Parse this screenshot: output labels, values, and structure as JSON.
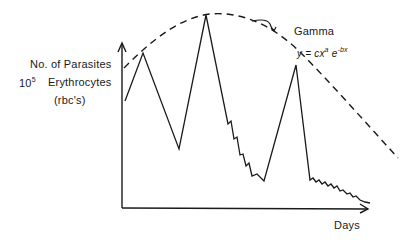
{
  "chart_data": {
    "type": "line",
    "title": "",
    "xlabel": "Days",
    "ylabel": "No. of Parasites / 10^5 Erythrocytes (rbc's)",
    "ylabel_lines": [
      "No. of Parasites",
      "10",
      "5",
      "Erythrocytes",
      "(rbc's)"
    ],
    "grid": false,
    "axis_ticks": "none",
    "series": [
      {
        "name": "Parasitemia",
        "style": "solid",
        "description": "Relapsing waves: rise to first peak, fall to trough, rise to highest peak, step-wise decline to trough, rise to third peak, then sharp drop followed by step-wise decline toward baseline",
        "points_px": [
          [
            125,
            101
          ],
          [
            143,
            53
          ],
          [
            179,
            149
          ],
          [
            206,
            15
          ],
          [
            228,
            124
          ],
          [
            231,
            121
          ],
          [
            234,
            139
          ],
          [
            237,
            137
          ],
          [
            240,
            155
          ],
          [
            243,
            154
          ],
          [
            246,
            166
          ],
          [
            249,
            163
          ],
          [
            252,
            176
          ],
          [
            257,
            174
          ],
          [
            264,
            181
          ],
          [
            296,
            65
          ],
          [
            310,
            180
          ],
          [
            313,
            178
          ],
          [
            316,
            182
          ],
          [
            319,
            180
          ],
          [
            322,
            184
          ],
          [
            325,
            182
          ],
          [
            328,
            186
          ],
          [
            331,
            184
          ],
          [
            334,
            188
          ],
          [
            337,
            186
          ],
          [
            340,
            191
          ],
          [
            343,
            190
          ],
          [
            347,
            194
          ],
          [
            350,
            193
          ],
          [
            353,
            197
          ],
          [
            356,
            196
          ],
          [
            360,
            200
          ],
          [
            365,
            202
          ],
          [
            370,
            203
          ]
        ]
      },
      {
        "name": "Gamma",
        "style": "dashed",
        "equation": "y = cx^a e^-bx",
        "points_px": [
          [
            124,
            68
          ],
          [
            150,
            45
          ],
          [
            180,
            24
          ],
          [
            210,
            14
          ],
          [
            240,
            18
          ],
          [
            270,
            30
          ],
          [
            300,
            54
          ],
          [
            330,
            88
          ],
          [
            360,
            118
          ],
          [
            398,
            158
          ]
        ]
      }
    ],
    "annotations": [
      {
        "text": "Gamma",
        "pointer": "curved-arrow"
      },
      {
        "text": "y = cx",
        "sup_a": "a",
        "mid": "e",
        "sup_bx": "-bx"
      }
    ]
  },
  "labels": {
    "y_line1": "No. of Parasites",
    "y_line2_num": "10",
    "y_line2_exp": "5",
    "y_line2_text": "Erythrocytes",
    "y_line3": "(rbc's)",
    "x_label": "Days",
    "gamma": "Gamma",
    "eq_base": "y = cx",
    "eq_a": "a",
    "eq_e": " e",
    "eq_exp": "-bx"
  },
  "colors": {
    "ink": "#1a1a1a",
    "background": "#ffffff"
  }
}
